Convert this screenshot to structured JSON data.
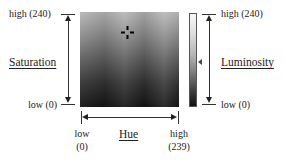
{
  "saturation_axis": {
    "title": "Saturation",
    "high_label": "high (240)",
    "low_label": "low (0)"
  },
  "luminosity_axis": {
    "title": "Luminosity",
    "high_label": "high (240)",
    "low_label": "low (0)"
  },
  "hue_axis": {
    "title": "Hue",
    "low_label_line1": "low",
    "low_label_line2": "(0)",
    "high_label_line1": "high",
    "high_label_line2": "(239)"
  },
  "color_field": {
    "icon": "crosshair-icon"
  },
  "luminosity_bar": {
    "slider_icon": "slider-arrow-icon"
  }
}
